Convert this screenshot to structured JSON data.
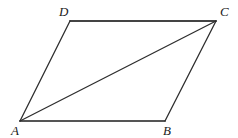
{
  "figure": {
    "name": "parallelogram-abcd-with-diagonal",
    "canvas": {
      "width": 238,
      "height": 138
    },
    "background_color": "#ffffff",
    "stroke_color": "#333333",
    "stroke_color_light": "#555555",
    "label_color": "#1a1a1a"
  },
  "vertices": {
    "A": {
      "label": "A",
      "x": 20,
      "y": 121,
      "label_x": 11,
      "label_y": 135
    },
    "B": {
      "label": "B",
      "x": 165,
      "y": 121,
      "label_x": 163,
      "label_y": 135
    },
    "C": {
      "label": "C",
      "x": 216,
      "y": 21,
      "label_x": 220,
      "label_y": 16
    },
    "D": {
      "label": "D",
      "x": 70,
      "y": 21,
      "label_x": 59,
      "label_y": 16
    }
  },
  "edges": [
    {
      "name": "edge-DC",
      "from": "D",
      "to": "C",
      "x1": 70,
      "y1": 21,
      "x2": 216,
      "y2": 21,
      "width": 1.8,
      "color": "#444444"
    },
    {
      "name": "edge-AB",
      "from": "A",
      "to": "B",
      "x1": 20,
      "y1": 121,
      "x2": 165,
      "y2": 121,
      "width": 1.8,
      "color": "#555555"
    },
    {
      "name": "edge-AD",
      "from": "A",
      "to": "D",
      "x1": 20,
      "y1": 121,
      "x2": 70,
      "y2": 21,
      "width": 1.3,
      "color": "#2e2e2e"
    },
    {
      "name": "edge-BC",
      "from": "B",
      "to": "C",
      "x1": 165,
      "y1": 121,
      "x2": 216,
      "y2": 21,
      "width": 1.3,
      "color": "#2e2e2e"
    },
    {
      "name": "diagonal-AC",
      "from": "A",
      "to": "C",
      "x1": 20,
      "y1": 121,
      "x2": 216,
      "y2": 21,
      "width": 1.3,
      "color": "#2e2e2e"
    }
  ]
}
